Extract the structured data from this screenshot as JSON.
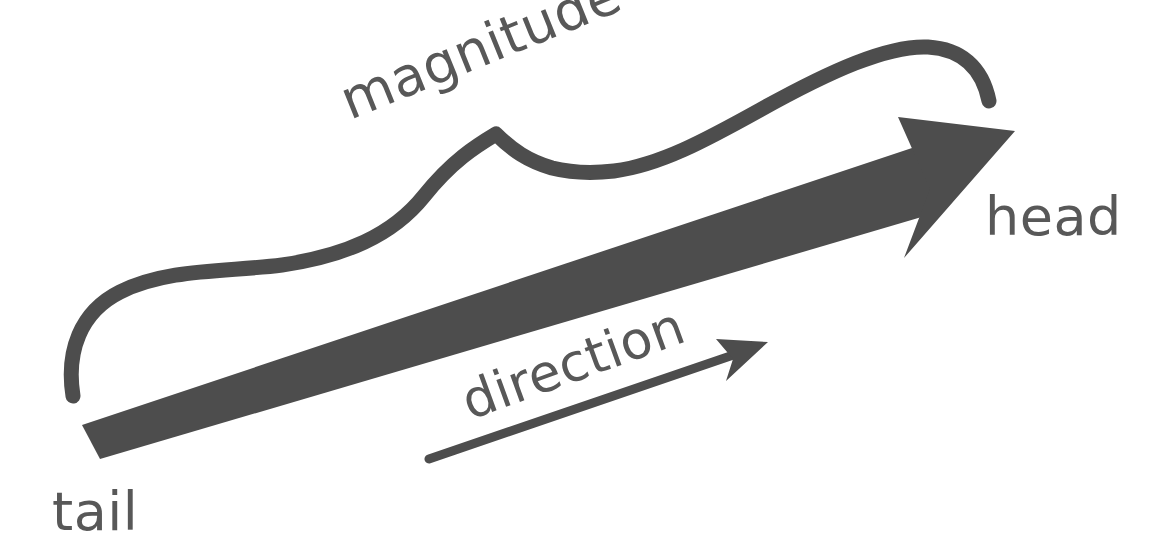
{
  "figure": {
    "background_color": "#ffffff",
    "ink_color": "#4d4d4d",
    "label_color": "#585858",
    "width": 1149,
    "height": 560
  },
  "labels": {
    "magnitude": "magnitude",
    "head": "head",
    "direction": "direction",
    "tail": "tail"
  },
  "label_geometry": {
    "magnitude": {
      "x": 350,
      "y": 120,
      "rotation": -22,
      "font_size": 54
    },
    "head": {
      "x": 985,
      "y": 235,
      "rotation": 0,
      "font_size": 54
    },
    "direction": {
      "x": 470,
      "y": 420,
      "rotation": -20,
      "font_size": 52
    },
    "tail": {
      "x": 52,
      "y": 530,
      "rotation": 0,
      "font_size": 54
    }
  },
  "shapes": {
    "vector_arrow": {
      "name": "main-vector-arrow",
      "tail_point": [
        82,
        450
      ],
      "head_point": [
        1012,
        133
      ],
      "shaft_thickness": 30,
      "head_width": 118,
      "head_length": 132
    },
    "magnitude_brace": {
      "name": "magnitude-curly-brace",
      "left_end": [
        72,
        396
      ],
      "peak": [
        496,
        134
      ],
      "valley": [
        604,
        172
      ],
      "right_crest": [
        938,
        47
      ],
      "right_end": [
        990,
        100
      ],
      "stroke_width": 15
    },
    "direction_arrow": {
      "name": "direction-indicator-arrow",
      "tail_point": [
        428,
        459
      ],
      "head_point": [
        766,
        343
      ],
      "stroke_width": 9,
      "head_width": 32,
      "head_length": 38
    }
  }
}
